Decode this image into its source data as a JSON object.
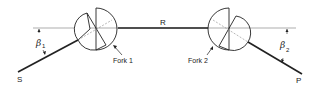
{
  "diagram": {
    "type": "two-fork path geometry",
    "labels": {
      "start": "S",
      "middle": "R",
      "end": "P",
      "fork1": "Fork 1",
      "fork2": "Fork 2",
      "angle1_symbol": "β",
      "angle1_sub": "1",
      "angle2_symbol": "β",
      "angle2_sub": "2"
    },
    "colors": {
      "line": "#222222",
      "thin_line": "#555555",
      "dashed": "#888888",
      "background": "#ffffff"
    }
  }
}
